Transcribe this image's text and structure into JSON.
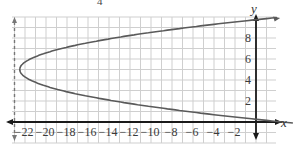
{
  "stray_text": "4",
  "chart_data": {
    "type": "line",
    "title": "",
    "xlabel": "x",
    "ylabel": "y",
    "xlim": [
      -23,
      1
    ],
    "ylim": [
      -1,
      10
    ],
    "grid": true,
    "x_ticks": [
      -22,
      -20,
      -18,
      -16,
      -14,
      -12,
      -10,
      -8,
      -6,
      -4,
      -2
    ],
    "x_tick_labels": [
      "−22",
      "−20",
      "−18",
      "−16",
      "−14",
      "−12",
      "−10",
      "−8",
      "−6",
      "−4",
      "−2"
    ],
    "y_ticks": [
      2,
      4,
      6,
      8
    ],
    "y_tick_labels": [
      "2",
      "4",
      "6",
      "8"
    ],
    "series": [
      {
        "name": "parabola",
        "equation": "x = (y - 5)^2 - 22.5 (approx)",
        "vertex": [
          -22.5,
          5
        ],
        "points": [
          [
            0,
            0.26
          ],
          [
            -6,
            0.94
          ],
          [
            -12,
            1.76
          ],
          [
            -18,
            2.88
          ],
          [
            -22.5,
            5
          ],
          [
            -18,
            7.12
          ],
          [
            -12,
            8.24
          ],
          [
            -6,
            9.06
          ],
          [
            0,
            9.74
          ]
        ],
        "color": "#5a5a5a"
      },
      {
        "name": "dashed vertical line",
        "x": -23,
        "style": "dashed",
        "color": "#777777"
      }
    ],
    "colors": {
      "grid": "#cfcfcf",
      "axis": "#1a1a1a",
      "curve": "#5a5a5a",
      "dashed": "#777777"
    }
  }
}
